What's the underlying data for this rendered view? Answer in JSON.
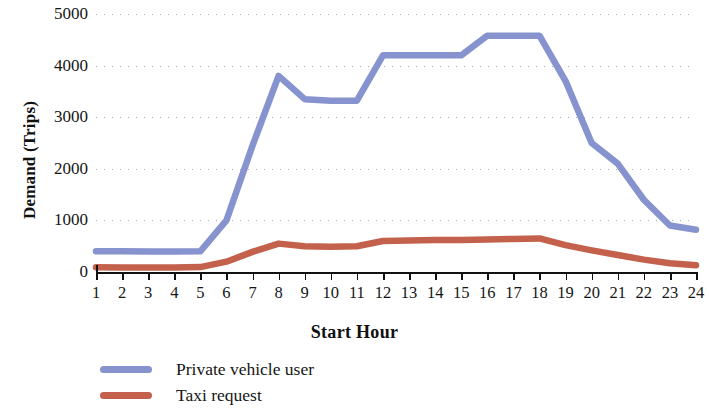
{
  "chart_data": {
    "type": "line",
    "title": "",
    "xlabel": "Start Hour",
    "ylabel": "Demand (Trips)",
    "x": [
      1,
      2,
      3,
      4,
      5,
      6,
      7,
      8,
      9,
      10,
      11,
      12,
      13,
      14,
      15,
      16,
      17,
      18,
      19,
      20,
      21,
      22,
      23,
      24
    ],
    "xtick_labels": [
      "1",
      "2",
      "3",
      "4",
      "5",
      "6",
      "7",
      "8",
      "9",
      "10",
      "11",
      "12",
      "13",
      "14",
      "15",
      "16",
      "17",
      "18",
      "19",
      "20",
      "21",
      "22",
      "23",
      "24"
    ],
    "ytick_labels": [
      "0",
      "1000",
      "2000",
      "3000",
      "4000",
      "5000"
    ],
    "yticks": [
      0,
      1000,
      2000,
      3000,
      4000,
      5000
    ],
    "xlim": [
      1,
      24
    ],
    "ylim": [
      0,
      5000
    ],
    "grid": true,
    "grid_style": "dotted-horizontal",
    "legend_position": "below-left",
    "series": [
      {
        "name": "Private vehicle user",
        "color": "#8693ce",
        "values": [
          400,
          400,
          395,
          395,
          400,
          1000,
          2450,
          3800,
          3350,
          3320,
          3320,
          4200,
          4200,
          4200,
          4200,
          4580,
          4580,
          4580,
          3700,
          2500,
          2100,
          1400,
          900,
          820
        ]
      },
      {
        "name": "Taxi request",
        "color": "#c4614c",
        "values": [
          90,
          88,
          85,
          85,
          95,
          200,
          390,
          550,
          500,
          490,
          500,
          600,
          610,
          620,
          620,
          630,
          640,
          650,
          520,
          420,
          330,
          240,
          170,
          130
        ]
      }
    ]
  },
  "axes": {
    "y_title": "Demand (Trips)",
    "x_title": "Start Hour"
  },
  "legend": {
    "items": [
      {
        "label": "Private vehicle user",
        "color": "#8693ce"
      },
      {
        "label": "Taxi request",
        "color": "#c4614c"
      }
    ]
  }
}
